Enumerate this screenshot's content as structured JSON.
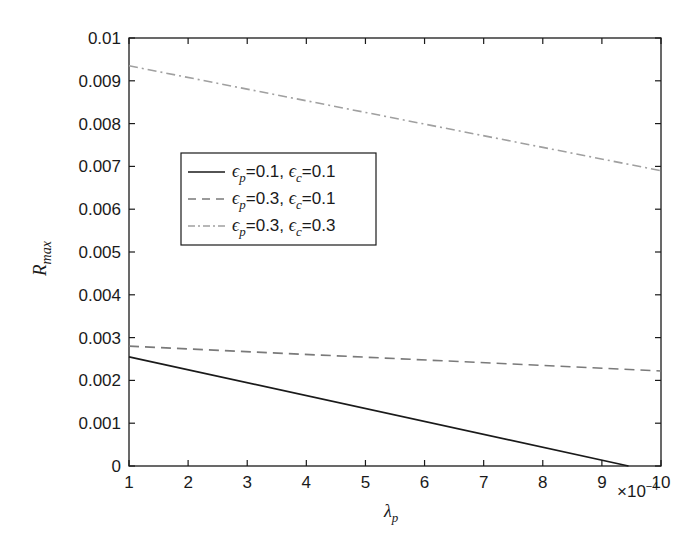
{
  "chart_data": {
    "type": "line",
    "title": "",
    "xlabel": "λp",
    "ylabel": "Rmax",
    "x_multiplier": "×10^-4",
    "xlim": [
      1,
      10
    ],
    "ylim": [
      0,
      0.01
    ],
    "grid": false,
    "legend_position": "upper-left (inset)",
    "x_ticks": [
      "1",
      "2",
      "3",
      "4",
      "5",
      "6",
      "7",
      "8",
      "9",
      "10"
    ],
    "y_ticks": [
      "0",
      "0.001",
      "0.002",
      "0.003",
      "0.004",
      "0.005",
      "0.006",
      "0.007",
      "0.008",
      "0.009",
      "0.01"
    ],
    "series": [
      {
        "name": "εp=0.1, εc=0.1",
        "style": "solid",
        "color": "#1a1a1a",
        "x": [
          1,
          9.45
        ],
        "y": [
          0.00255,
          0.0
        ]
      },
      {
        "name": "εp=0.3, εc=0.1",
        "style": "dashed",
        "color": "#7a7a7a",
        "x": [
          1,
          10
        ],
        "y": [
          0.0028,
          0.00222
        ]
      },
      {
        "name": "εp=0.3, εc=0.3",
        "style": "dash-dot",
        "color": "#a0a0a0",
        "x": [
          1,
          10
        ],
        "y": [
          0.00935,
          0.0069
        ]
      }
    ]
  },
  "labels": {
    "x_axis_symbol": "λ",
    "x_axis_sub": "p",
    "y_axis_symbol": "R",
    "y_axis_sub": "max",
    "multiplier_base": "×10",
    "multiplier_exp": "−4"
  },
  "legend": [
    {
      "eps": "ϵ",
      "sub1": "p",
      "val1": "=0.1, ",
      "sub2": "c",
      "val2": "=0.1"
    },
    {
      "eps": "ϵ",
      "sub1": "p",
      "val1": "=0.3, ",
      "sub2": "c",
      "val2": "=0.1"
    },
    {
      "eps": "ϵ",
      "sub1": "p",
      "val1": "=0.3, ",
      "sub2": "c",
      "val2": "=0.3"
    }
  ]
}
